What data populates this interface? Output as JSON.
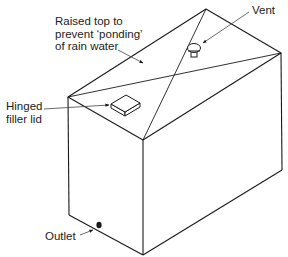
{
  "diagram": {
    "colors": {
      "line": "#1a1a1a",
      "leader": "#444444",
      "text": "#222222",
      "background": "#ffffff"
    },
    "labels": {
      "raised_top": {
        "lines": [
          "Raised top to",
          "prevent ‘ponding’",
          "of rain water"
        ]
      },
      "hinged_lid": {
        "lines": [
          "Hinged",
          "filler lid"
        ]
      },
      "vent": {
        "text": "Vent"
      },
      "outlet": {
        "text": "Outlet"
      }
    },
    "components": [
      {
        "name": "tank-body",
        "shape": "rectangular box"
      },
      {
        "name": "raised-top",
        "shape": "shallow pyramid with X ridges"
      },
      {
        "name": "hinged-filler-lid",
        "shape": "small square hatch"
      },
      {
        "name": "vent",
        "shape": "mushroom cap vent"
      },
      {
        "name": "outlet",
        "shape": "round outlet near base"
      }
    ]
  }
}
